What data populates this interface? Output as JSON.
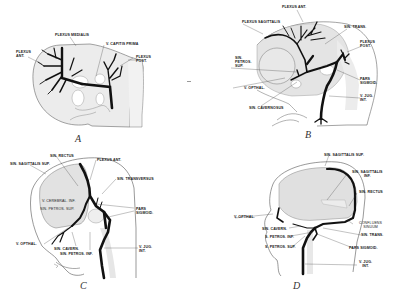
{
  "figure": {
    "type": "anatomical-diagram",
    "colors": {
      "vein": "#111111",
      "brain_shading": "#e2e2e2",
      "outline": "#555555",
      "background": "#ffffff"
    }
  },
  "panels": [
    {
      "id": "A",
      "caption": "A",
      "labels": {
        "plexus_medialis": "PLEXUS MEDIALIS",
        "plexus_ant": "PLEXUS\nANT.",
        "v_capitis_prima": "V. CAPITIS PRIMA",
        "plexus_post": "PLEXUS\nPOST."
      }
    },
    {
      "id": "B",
      "caption": "B",
      "labels": {
        "plexus_ant": "PLEXUS ANT.",
        "plexus_sagittalis": "PLEXUS SAGITTALIS",
        "sin_trans": "SIN. TRANS.",
        "plexus_post": "PLEXUS\nPOST.",
        "sin_petros_sup": "SIN.\nPETROS.\nSUP.",
        "pars_sigmoid": "PARS\nSIGMOID.",
        "v_opthal": "V. OPTHAL.",
        "v_jug_int": "V. JUG.\nINT.",
        "sin_cavernosus": "SIN. CAVERNOSUS"
      }
    },
    {
      "id": "C",
      "caption": "C",
      "labels": {
        "sin_rectus": "SIN. RECTUS",
        "sin_sagittalis_sup": "SIN. SAGITTALIS SUP.",
        "plexus_ant": "PLEXUS ANT.",
        "sin_transversus": "SIN. TRANSVERSUS",
        "v_cerebral_inf": "V. CEREBRAL. INF.",
        "sin_petros_sup": "SIN. PETROS. SUP.",
        "pars_sigmoid": "PARS\nSIGMOID.",
        "v_opthal": "V. OPTHAL.",
        "sin_cavern": "SIN. CAVERN.",
        "sin_petros_inf": "SIN. PETROS. INF.",
        "v_jug_int": "V. JUG.\nINT."
      }
    },
    {
      "id": "D",
      "caption": "D",
      "labels": {
        "sin_sagittalis_sup": "SIN. SAGITTALIS SUP.",
        "sin_sagittalis_inf": "SIN. SAGITTALIS\nINF.",
        "sin_rectus": "SIN. RECTUS",
        "v_opthal": "V. OPTHAL.",
        "confluens_sinuum": "CONFLUENS\nSINUUM",
        "sin_cavern": "SIN. CAVERN.",
        "sin_trans": "SIN. TRANS.",
        "s_petros_inf": "S. PETROS. INF.",
        "pars_sigmoid": "PARS SIGMOID.",
        "s_petros_sup": "S. PETROS. SUP.",
        "v_jug_int": "V. JUG.\nINT."
      }
    }
  ]
}
